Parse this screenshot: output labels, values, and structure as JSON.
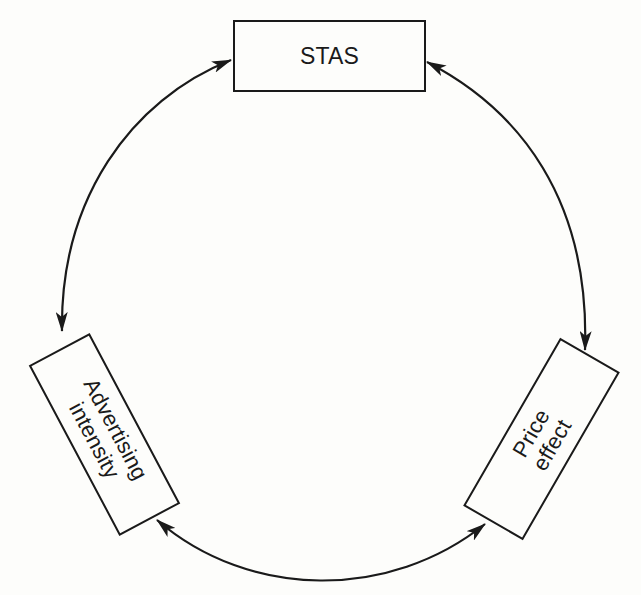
{
  "diagram": {
    "type": "cycle",
    "nodes": [
      {
        "id": "stas",
        "label": "STAS"
      },
      {
        "id": "advertising_intensity",
        "label": "Advertising\nintensity"
      },
      {
        "id": "price_effect",
        "label": "Price\neffect"
      }
    ],
    "edges": [
      {
        "from": "stas",
        "to": "advertising_intensity",
        "direction": "bidirectional"
      },
      {
        "from": "stas",
        "to": "price_effect",
        "direction": "bidirectional"
      },
      {
        "from": "advertising_intensity",
        "to": "price_effect",
        "direction": "bidirectional"
      }
    ],
    "colors": {
      "stroke": "#1a1a1a",
      "background": "#fdfdfb"
    }
  }
}
